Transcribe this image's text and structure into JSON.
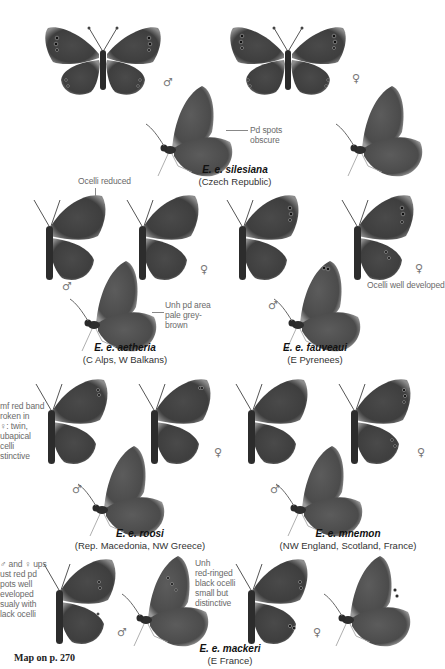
{
  "page": {
    "header_text": "",
    "map_reference": "Map on p. 270",
    "colors": {
      "wing_dark": "#3a3a3a",
      "wing_mid": "#5a5a5a",
      "wing_edge": "#8a8a8a",
      "ocelli": "#111111",
      "ocelli_ring": "#b8b8b8",
      "note_text": "#6a6a6a"
    }
  },
  "symbols": {
    "male": "♂",
    "female": "♀"
  },
  "subspecies": [
    {
      "id": "silesiana",
      "name": "E. e. silesiana",
      "locality": "(Czech Republic)",
      "notes": [
        "Pd spots obscure"
      ]
    },
    {
      "id": "aetheria",
      "name": "E. e. aetheria",
      "locality": "(C Alps, W Balkans)",
      "notes": [
        "Ocelli reduced",
        "Unh pd area pale grey-brown"
      ]
    },
    {
      "id": "fauveaui",
      "name": "E. e. fauveaui",
      "locality": "(E Pyrenees)",
      "notes": [
        "Ocelli well developed"
      ]
    },
    {
      "id": "roosi",
      "name": "E. e. roosi",
      "locality": "(Rep. Macedonia, NW Greece)",
      "notes": [
        "Upf red band broken in ♀: twin, subapical ocelli distinctive"
      ]
    },
    {
      "id": "mnemon",
      "name": "E. e. mnemon",
      "locality": "(NW England, Scotland, France)",
      "notes": []
    },
    {
      "id": "mackeri",
      "name": "E. e. mackeri",
      "locality": "(E France)",
      "notes": [
        "♂ and ♀ ups lust red pd spots well developed usualy with black ocelli",
        "Unh red-ringed black ocelli small but distinctive"
      ]
    }
  ],
  "notes_display": {
    "pd_spots": "Pd spots\nobscure",
    "ocelli_reduced": "Ocelli reduced",
    "unh_pale": "Unh pd area\npale grey-\nbrown",
    "ocelli_well": "Ocelli well developed",
    "roosi_left": "mf red band\nroken in\n♀: twin,\nubapical\ncelli\nstinctive",
    "mackeri_left": "♂ and ♀ ups\nust red pd\npots well\neveloped\nsualy with\nlack ocelli",
    "mackeri_unh": "Unh\nred-ringed\nblack ocelli\nsmall but\ndistinctive"
  }
}
